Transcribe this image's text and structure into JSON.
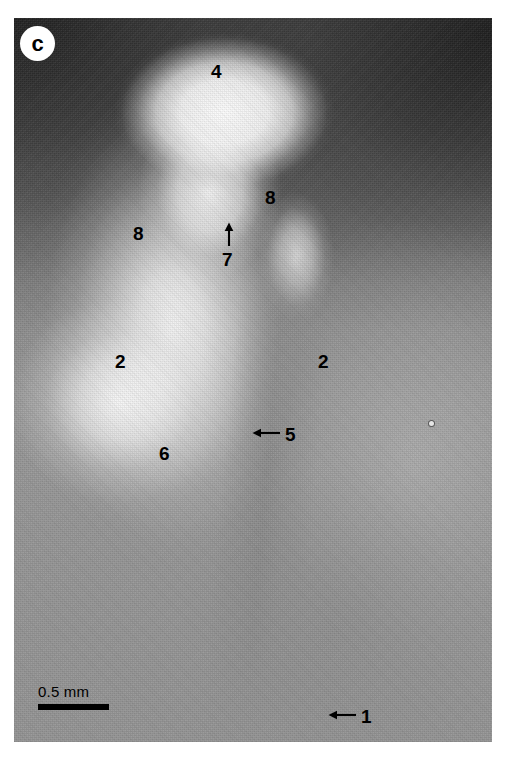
{
  "figure": {
    "panel_label": "c",
    "type": "light-micrograph",
    "scale_bar": {
      "label": "0.5 mm",
      "length_px": 71
    }
  },
  "annotations": [
    {
      "id": "label-4",
      "text": "4",
      "x": 218,
      "y": 70,
      "arrow": "none"
    },
    {
      "id": "label-8-right",
      "text": "8",
      "x": 271,
      "y": 195,
      "arrow": "none"
    },
    {
      "id": "label-8-left",
      "text": "8",
      "x": 139,
      "y": 231,
      "arrow": "none"
    },
    {
      "id": "label-7",
      "text": "7",
      "x": 228,
      "y": 252,
      "arrow": "up"
    },
    {
      "id": "label-2-left",
      "text": "2",
      "x": 120,
      "y": 352,
      "arrow": "none"
    },
    {
      "id": "label-2-right",
      "text": "2",
      "x": 322,
      "y": 352,
      "arrow": "none"
    },
    {
      "id": "label-6",
      "text": "6",
      "x": 163,
      "y": 444,
      "arrow": "none"
    },
    {
      "id": "label-5",
      "text": "5",
      "x": 287,
      "y": 425,
      "arrow": "left"
    },
    {
      "id": "label-1",
      "text": "1",
      "x": 363,
      "y": 707,
      "arrow": "left"
    }
  ],
  "labels": {
    "l4": "4",
    "l8a": "8",
    "l8b": "8",
    "l7": "7",
    "l2a": "2",
    "l2b": "2",
    "l6": "6",
    "l5": "5",
    "l1": "1"
  },
  "colors": {
    "annotation": "#000000",
    "panel_label_bg": "#ffffff",
    "panel_label_fg": "#000000",
    "page_bg": "#ffffff",
    "field_mid_gray": "#949494",
    "field_dark": "#3b3b3b",
    "tissue_bright": "#ffffff"
  }
}
